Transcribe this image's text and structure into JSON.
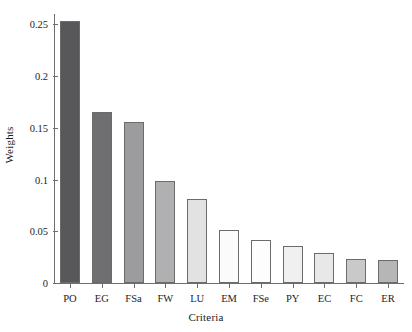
{
  "chart_data": {
    "type": "bar",
    "title": "",
    "xlabel": "Criteria",
    "ylabel": "Weights",
    "categories": [
      "PO",
      "EG",
      "FSa",
      "FW",
      "LU",
      "EM",
      "FSe",
      "PY",
      "EC",
      "FC",
      "ER"
    ],
    "values": [
      0.253,
      0.165,
      0.156,
      0.099,
      0.081,
      0.051,
      0.0415,
      0.036,
      0.029,
      0.023,
      0.022
    ],
    "bar_colors": [
      "#58585a",
      "#6f6f71",
      "#9c9c9e",
      "#b0b0b2",
      "#e2e2e2",
      "#fbfbfb",
      "#fdfdfd",
      "#f0f0f0",
      "#e8e8e8",
      "#c9c9c9",
      "#b6b6b6"
    ],
    "bar_edge_color": "#6b6b6b",
    "ylim": [
      0,
      0.26
    ],
    "yticks": [
      0,
      0.05,
      0.1,
      0.15,
      0.2,
      0.25
    ],
    "ytick_labels": [
      "0",
      "0.05",
      "0.1",
      "0.15",
      "0.2",
      "0.25"
    ],
    "grid": false,
    "legend": null,
    "axis_color": "#6e6e6e",
    "background": "#ffffff"
  }
}
